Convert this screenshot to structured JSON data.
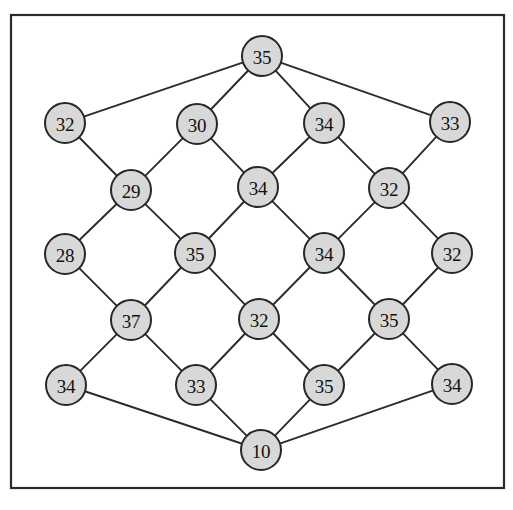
{
  "figure": {
    "type": "node-link-diagram",
    "canvas": {
      "width": 513,
      "height": 510
    },
    "frame": {
      "x": 11,
      "y": 15,
      "width": 493,
      "height": 473,
      "stroke_color": "#2b2b2b"
    },
    "node_style": {
      "radius": 20,
      "fill_color": "#d8d8d8",
      "stroke_color": "#272727",
      "label_color": "#111111"
    },
    "edge_style": {
      "stroke_color": "#2b2b2b",
      "stroke_width": 1.9
    }
  },
  "nodes": [
    {
      "id": "n0",
      "label": "35",
      "x": 262,
      "y": 56,
      "role": "top-apex"
    },
    {
      "id": "n1",
      "label": "32",
      "x": 65,
      "y": 123,
      "role": "lattice"
    },
    {
      "id": "n2",
      "label": "30",
      "x": 197,
      "y": 124,
      "role": "lattice"
    },
    {
      "id": "n3",
      "label": "34",
      "x": 324,
      "y": 123,
      "role": "lattice"
    },
    {
      "id": "n4",
      "label": "33",
      "x": 450,
      "y": 122,
      "role": "lattice"
    },
    {
      "id": "n5",
      "label": "29",
      "x": 131,
      "y": 190,
      "role": "lattice"
    },
    {
      "id": "n6",
      "label": "34",
      "x": 258,
      "y": 187,
      "role": "lattice"
    },
    {
      "id": "n7",
      "label": "32",
      "x": 389,
      "y": 188,
      "role": "lattice"
    },
    {
      "id": "n8",
      "label": "28",
      "x": 65,
      "y": 254,
      "role": "lattice"
    },
    {
      "id": "n9",
      "label": "35",
      "x": 195,
      "y": 253,
      "role": "lattice"
    },
    {
      "id": "n10",
      "label": "34",
      "x": 324,
      "y": 253,
      "role": "lattice"
    },
    {
      "id": "n11",
      "label": "32",
      "x": 452,
      "y": 253,
      "role": "lattice"
    },
    {
      "id": "n12",
      "label": "37",
      "x": 131,
      "y": 320,
      "role": "lattice"
    },
    {
      "id": "n13",
      "label": "32",
      "x": 259,
      "y": 319,
      "role": "lattice"
    },
    {
      "id": "n14",
      "label": "35",
      "x": 389,
      "y": 319,
      "role": "lattice"
    },
    {
      "id": "n15",
      "label": "34",
      "x": 66,
      "y": 385,
      "role": "lattice"
    },
    {
      "id": "n16",
      "label": "33",
      "x": 196,
      "y": 385,
      "role": "lattice"
    },
    {
      "id": "n17",
      "label": "35",
      "x": 324,
      "y": 385,
      "role": "lattice"
    },
    {
      "id": "n18",
      "label": "34",
      "x": 452,
      "y": 384,
      "role": "lattice"
    },
    {
      "id": "n19",
      "label": "10",
      "x": 261,
      "y": 450,
      "role": "bottom-apex"
    }
  ],
  "edges": [
    {
      "from": "n0",
      "to": "n1"
    },
    {
      "from": "n0",
      "to": "n2"
    },
    {
      "from": "n0",
      "to": "n3"
    },
    {
      "from": "n0",
      "to": "n4"
    },
    {
      "from": "n1",
      "to": "n5"
    },
    {
      "from": "n2",
      "to": "n5"
    },
    {
      "from": "n2",
      "to": "n6"
    },
    {
      "from": "n3",
      "to": "n6"
    },
    {
      "from": "n3",
      "to": "n7"
    },
    {
      "from": "n4",
      "to": "n7"
    },
    {
      "from": "n5",
      "to": "n8"
    },
    {
      "from": "n5",
      "to": "n9"
    },
    {
      "from": "n6",
      "to": "n9"
    },
    {
      "from": "n6",
      "to": "n10"
    },
    {
      "from": "n7",
      "to": "n10"
    },
    {
      "from": "n7",
      "to": "n11"
    },
    {
      "from": "n8",
      "to": "n12"
    },
    {
      "from": "n9",
      "to": "n12"
    },
    {
      "from": "n9",
      "to": "n13"
    },
    {
      "from": "n10",
      "to": "n13"
    },
    {
      "from": "n10",
      "to": "n14"
    },
    {
      "from": "n11",
      "to": "n14"
    },
    {
      "from": "n12",
      "to": "n15"
    },
    {
      "from": "n12",
      "to": "n16"
    },
    {
      "from": "n13",
      "to": "n16"
    },
    {
      "from": "n13",
      "to": "n17"
    },
    {
      "from": "n14",
      "to": "n17"
    },
    {
      "from": "n14",
      "to": "n18"
    },
    {
      "from": "n15",
      "to": "n19"
    },
    {
      "from": "n16",
      "to": "n19"
    },
    {
      "from": "n17",
      "to": "n19"
    },
    {
      "from": "n18",
      "to": "n19"
    }
  ]
}
